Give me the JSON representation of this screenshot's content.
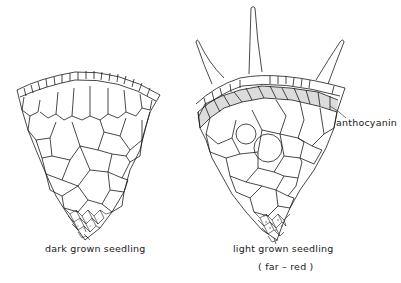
{
  "figure": {
    "left_section": {
      "label": "dark grown seedling"
    },
    "right_section": {
      "label": "light grown seedling",
      "sublabel": "( far – red )",
      "annotation": "anthocyanin",
      "hair_count": 3
    },
    "colors": {
      "line": "#1a1a1a",
      "anthocyanin_fill": "#dcdcdc",
      "background": "#ffffff"
    }
  }
}
